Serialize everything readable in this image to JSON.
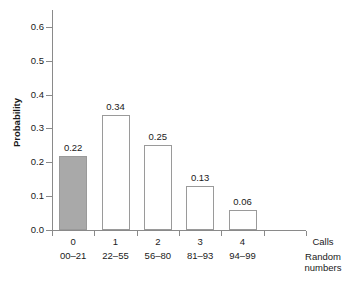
{
  "chart_data": {
    "type": "bar",
    "title": "",
    "subtitle": "",
    "xlabel": "Calls",
    "xlabel_secondary": "Random numbers",
    "ylabel": "Probability",
    "ylim": [
      0.0,
      0.65
    ],
    "ytick_values": [
      0.0,
      0.1,
      0.2,
      0.3,
      0.4,
      0.5,
      0.6
    ],
    "ytick_labels": [
      "0.0",
      "0.1",
      "0.2",
      "0.3",
      "0.4",
      "0.5",
      "0.6"
    ],
    "grid": false,
    "legend": false,
    "categories": [
      "0",
      "1",
      "2",
      "3",
      "4"
    ],
    "category_sublabels": [
      "00–21",
      "22–55",
      "56–80",
      "81–93",
      "94–99"
    ],
    "values": [
      0.22,
      0.34,
      0.25,
      0.13,
      0.06
    ],
    "value_labels": [
      "0.22",
      "0.34",
      "0.25",
      "0.13",
      "0.06"
    ],
    "bar_styles": [
      "filled",
      "hollow",
      "hollow",
      "hollow",
      "hollow"
    ],
    "colors": {
      "bar_fill": "#a9a9a9",
      "bar_hollow_fill": "#ffffff",
      "bar_edge": "#9a9a9a",
      "axis": "#8a8a8a",
      "text": "#1a1a1a",
      "background": "#ffffff"
    }
  }
}
